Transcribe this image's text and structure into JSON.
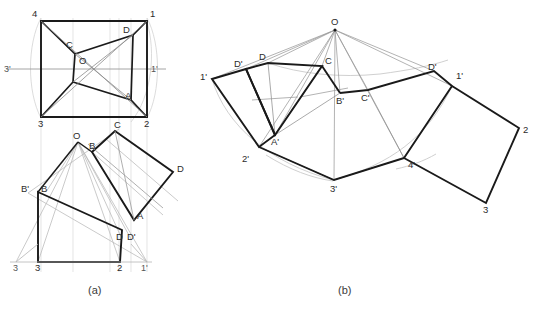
{
  "figure": {
    "background_color": "#ffffff",
    "heavy_line_color": "#1a1a1a",
    "light_line_color": "#8f8f8f",
    "faint_line_color": "#cdcdcd",
    "arc_color": "#cfcfcf",
    "label_color": "#2b2b2b"
  },
  "captions": {
    "panel_a": "(a)",
    "panel_b": "(b)",
    "footnote": ""
  },
  "panel_a": {
    "name": "plan-and-elevation-views",
    "top_view": {
      "name": "top-view-square",
      "corner_labels": [
        "4",
        "1",
        "2",
        "3"
      ],
      "inner_labels": [
        "C",
        "D",
        "O",
        "A"
      ],
      "axis_labels": [
        "3'",
        "1'"
      ]
    },
    "front_view": {
      "name": "front-view-auxiliary",
      "labels": [
        "O",
        "C",
        "B",
        "B'",
        "D",
        "A",
        "D'",
        "3",
        "2",
        "3'",
        "1'"
      ]
    }
  },
  "panel_b": {
    "name": "surface-development",
    "labels": [
      "O",
      "D",
      "C",
      "D'",
      "1'",
      "2",
      "3",
      "4'",
      "3'",
      "2'",
      "1'",
      "A'",
      "B'",
      "C'",
      "D'"
    ],
    "apex_label": "O"
  },
  "labels_panel_a_top": [
    {
      "text": "4",
      "x": 32,
      "y": 17,
      "kind": "corner"
    },
    {
      "text": "1",
      "x": 150,
      "y": 17,
      "kind": "corner"
    },
    {
      "text": "3",
      "x": 38,
      "y": 119,
      "kind": "corner"
    },
    {
      "text": "2",
      "x": 144,
      "y": 119,
      "kind": "corner"
    },
    {
      "text": "C",
      "x": 66,
      "y": 44,
      "kind": "inner"
    },
    {
      "text": "D",
      "x": 124,
      "y": 32,
      "kind": "inner"
    },
    {
      "text": "O",
      "x": 80,
      "y": 61,
      "kind": "inner"
    },
    {
      "text": "A",
      "x": 126,
      "y": 96,
      "kind": "inner"
    },
    {
      "text": "3'",
      "x": 5,
      "y": 74,
      "kind": "axis"
    },
    {
      "text": "1'",
      "x": 152,
      "y": 74,
      "kind": "axis"
    }
  ],
  "labels_panel_a_front": [
    {
      "text": "O",
      "x": 75,
      "y": 136
    },
    {
      "text": "C",
      "x": 118,
      "y": 124
    },
    {
      "text": "B",
      "x": 91,
      "y": 146
    },
    {
      "text": "B'",
      "x": 25,
      "y": 186
    },
    {
      "text": "B",
      "x": 43,
      "y": 186
    },
    {
      "text": "D",
      "x": 178,
      "y": 168
    },
    {
      "text": "A",
      "x": 139,
      "y": 216
    },
    {
      "text": "D",
      "x": 119,
      "y": 235
    },
    {
      "text": "D'",
      "x": 131,
      "y": 235
    },
    {
      "text": "3",
      "x": 17,
      "y": 264
    },
    {
      "text": "3",
      "x": 38,
      "y": 264
    },
    {
      "text": "2",
      "x": 120,
      "y": 264
    },
    {
      "text": "1'",
      "x": 143,
      "y": 264
    }
  ],
  "labels_panel_b": [
    {
      "text": "O",
      "x": 333,
      "y": 22
    },
    {
      "text": "D",
      "x": 262,
      "y": 63
    },
    {
      "text": "C",
      "x": 327,
      "y": 62
    },
    {
      "text": "D'",
      "x": 238,
      "y": 70
    },
    {
      "text": "1'",
      "x": 203,
      "y": 81
    },
    {
      "text": "D'",
      "x": 431,
      "y": 73
    },
    {
      "text": "1'",
      "x": 459,
      "y": 79
    },
    {
      "text": "B'",
      "x": 339,
      "y": 100
    },
    {
      "text": "C'",
      "x": 364,
      "y": 99
    },
    {
      "text": "A'",
      "x": 276,
      "y": 125
    },
    {
      "text": "2",
      "x": 521,
      "y": 134
    },
    {
      "text": "2'",
      "x": 245,
      "y": 160
    },
    {
      "text": "4'",
      "x": 412,
      "y": 163
    },
    {
      "text": "3'",
      "x": 333,
      "y": 187
    },
    {
      "text": "3",
      "x": 486,
      "y": 211
    }
  ],
  "caption_positions": {
    "panel_a": {
      "x": 88,
      "y": 291
    },
    "panel_b": {
      "x": 338,
      "y": 291
    }
  }
}
